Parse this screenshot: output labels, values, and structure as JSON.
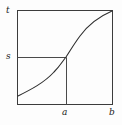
{
  "figure": {
    "name": "cumulative-distribution-curve-diagram",
    "background_color": "#fdfdfd",
    "line_color": "#3c3c3c",
    "label_color": "#1a1a1a"
  },
  "labels": {
    "t": "t",
    "s": "s",
    "a": "a",
    "b": "b"
  },
  "chart_data": {
    "type": "line",
    "title": "",
    "xlabel": "",
    "ylabel": "",
    "grid": false,
    "legend": null,
    "frame": {
      "left_px": 17,
      "right_px": 112,
      "top_px": 10,
      "bottom_px": 104,
      "border": true
    },
    "axis_ticks": {
      "x": [
        {
          "label": "a",
          "px": 66
        },
        {
          "label": "b",
          "px": 112
        }
      ],
      "y": [
        {
          "label": "s",
          "px": 57
        },
        {
          "label": "t",
          "px": 11
        }
      ]
    },
    "series": [
      {
        "name": "sigmoid-curve",
        "points_px": [
          [
            18,
            96
          ],
          [
            24,
            93
          ],
          [
            30,
            90
          ],
          [
            36,
            87
          ],
          [
            42,
            83
          ],
          [
            48,
            78
          ],
          [
            54,
            72
          ],
          [
            60,
            65
          ],
          [
            66,
            57
          ],
          [
            72,
            48
          ],
          [
            78,
            39
          ],
          [
            84,
            31
          ],
          [
            90,
            25
          ],
          [
            96,
            20
          ],
          [
            102,
            16
          ],
          [
            108,
            13
          ],
          [
            112,
            11
          ]
        ],
        "path": "M 18 96 C 30 90, 44 83, 54 72 C 60 66, 62 62, 66 57 C 70 51, 74 44, 80 36 C 88 25, 98 17, 112 11"
      }
    ],
    "guide_lines": [
      {
        "name": "s-horizontal-guide",
        "orientation": "horizontal",
        "from_px": [
          17,
          57
        ],
        "to_px": [
          66,
          57
        ],
        "value_label": "s"
      },
      {
        "name": "a-vertical-guide",
        "orientation": "vertical",
        "from_px": [
          66,
          57
        ],
        "to_px": [
          66,
          104
        ],
        "value_label": "a"
      }
    ],
    "annotations": [
      {
        "name": "curve-meets-top-right",
        "at_px": [
          112,
          11
        ]
      },
      {
        "name": "curve-crosses-s-at-a",
        "at_px": [
          66,
          57
        ]
      }
    ]
  }
}
